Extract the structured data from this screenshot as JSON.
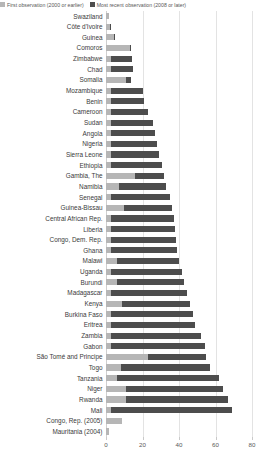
{
  "legend": {
    "items": [
      {
        "label": "First observation (2000 or earlier)",
        "color": "#b6b6b6",
        "name": "legend-first-observation"
      },
      {
        "label": "Most recent observation (2008 or later)",
        "color": "#4d4d4d",
        "name": "legend-most-recent-observation"
      }
    ]
  },
  "colors": {
    "first": "#b6b6b6",
    "recent": "#4d4d4d",
    "grid": "#e3e3e3",
    "text": "#3a3a3a"
  },
  "axis": {
    "ticks": [
      0,
      20,
      40,
      60,
      80
    ],
    "min": 0,
    "max": 80
  },
  "chart_data": {
    "type": "bar",
    "orientation": "horizontal",
    "stacked": false,
    "title": "",
    "xlabel": "",
    "ylabel": "",
    "xlim": [
      0,
      80
    ],
    "grid": true,
    "legend_position": "top-left",
    "categories": [
      "Swaziland",
      "Côte d'Ivoire",
      "Guinea",
      "Comoros",
      "Zimbabwe",
      "Chad",
      "Somalia",
      "Mozambique",
      "Benin",
      "Cameroon",
      "Sudan",
      "Angola",
      "Nigeria",
      "Sierra Leone",
      "Ethiopia",
      "Gambia, The",
      "Namibia",
      "Senegal",
      "Guinea-Bissau",
      "Central African Rep.",
      "Liberia",
      "Congo, Dem. Rep.",
      "Ghana",
      "Malawi",
      "Uganda",
      "Burundi",
      "Madagascar",
      "Kenya",
      "Burkina Faso",
      "Eritrea",
      "Zambia",
      "Gabon",
      "São Tomé and Principe",
      "Togo",
      "Tanzania",
      "Niger",
      "Rwanda",
      "Mali",
      "Congo, Rep. (2005)",
      "Mauritania (2004)"
    ],
    "series": [
      {
        "name": "First observation (2000 or earlier)",
        "color": "#b6b6b6",
        "values": [
          1.5,
          2.0,
          4.5,
          13.0,
          3.0,
          3.0,
          11.0,
          2.5,
          2.5,
          3.0,
          3.0,
          3.0,
          3.0,
          3.0,
          3.0,
          16.0,
          7.0,
          3.0,
          10.0,
          3.0,
          3.0,
          3.0,
          3.0,
          6.0,
          3.0,
          6.0,
          3.0,
          9.0,
          3.0,
          3.0,
          3.0,
          3.0,
          23.0,
          8.0,
          6.0,
          11.0,
          11.0,
          3.0,
          9.0,
          1.5
        ]
      },
      {
        "name": "Most recent observation (2008 or later)",
        "color": "#4d4d4d",
        "values": [
          1.5,
          2.5,
          5.0,
          13.5,
          14.5,
          15.0,
          13.5,
          20.0,
          21.0,
          23.0,
          25.5,
          27.0,
          28.0,
          29.0,
          30.5,
          32.0,
          33.0,
          35.0,
          36.0,
          37.5,
          38.0,
          38.5,
          39.0,
          40.0,
          41.5,
          43.0,
          44.5,
          46.0,
          47.5,
          49.0,
          52.0,
          54.0,
          55.0,
          57.0,
          62.0,
          64.0,
          67.0,
          69.0,
          9.0,
          1.5
        ]
      }
    ]
  }
}
